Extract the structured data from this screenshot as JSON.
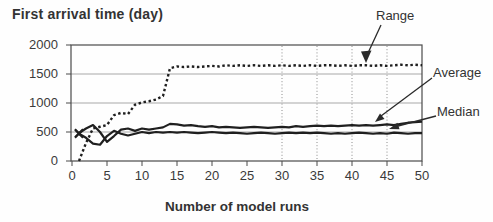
{
  "chart_data": {
    "type": "line",
    "title": "First arrival time (day)",
    "xlabel": "Number of model runs",
    "ylabel": "",
    "xlim": [
      0,
      50
    ],
    "ylim": [
      0,
      2000
    ],
    "xticks": [
      0,
      5,
      10,
      15,
      20,
      25,
      30,
      35,
      40,
      45,
      50
    ],
    "yticks": [
      0,
      500,
      1000,
      1500,
      2000
    ],
    "horizontal_gridlines_at_y": [
      500,
      1000,
      1500,
      2000
    ],
    "vertical_gridlines_at_x": [
      30,
      35,
      40,
      45
    ],
    "legend_position": "right-callouts",
    "x": [
      1,
      2,
      3,
      4,
      5,
      6,
      7,
      8,
      9,
      10,
      11,
      12,
      13,
      14,
      15,
      16,
      17,
      18,
      19,
      20,
      21,
      22,
      23,
      24,
      25,
      26,
      27,
      28,
      29,
      30,
      31,
      32,
      33,
      34,
      35,
      36,
      37,
      38,
      39,
      40,
      41,
      42,
      43,
      44,
      45,
      46,
      47,
      48,
      49,
      50
    ],
    "series": [
      {
        "name": "Range",
        "style": "dotted",
        "start_marker": "none",
        "values": [
          0,
          310,
          560,
          590,
          620,
          790,
          830,
          810,
          970,
          1010,
          1030,
          1060,
          1120,
          1600,
          1630,
          1620,
          1630,
          1620,
          1630,
          1640,
          1630,
          1650,
          1640,
          1650,
          1640,
          1650,
          1640,
          1650,
          1640,
          1650,
          1640,
          1650,
          1640,
          1650,
          1640,
          1650,
          1650,
          1640,
          1650,
          1640,
          1650,
          1650,
          1640,
          1650,
          1640,
          1650,
          1660,
          1650,
          1660,
          1650
        ]
      },
      {
        "name": "Average",
        "style": "solid",
        "start_marker": "x",
        "values": [
          480,
          560,
          620,
          500,
          330,
          430,
          540,
          560,
          520,
          560,
          540,
          560,
          580,
          640,
          630,
          610,
          620,
          600,
          590,
          600,
          580,
          590,
          580,
          570,
          580,
          590,
          580,
          570,
          580,
          590,
          580,
          600,
          590,
          600,
          610,
          600,
          610,
          600,
          610,
          620,
          610,
          620,
          610,
          620,
          630,
          620,
          640,
          660,
          670,
          680
        ]
      },
      {
        "name": "Median",
        "style": "solid",
        "start_marker": "x",
        "values": [
          470,
          400,
          300,
          280,
          430,
          520,
          470,
          440,
          470,
          500,
          480,
          500,
          490,
          500,
          490,
          500,
          490,
          480,
          490,
          500,
          490,
          480,
          490,
          480,
          470,
          480,
          490,
          480,
          470,
          480,
          490,
          480,
          490,
          480,
          490,
          480,
          470,
          480,
          470,
          480,
          490,
          480,
          470,
          480,
          470,
          490,
          480,
          470,
          480,
          480
        ]
      }
    ]
  },
  "colors": {
    "series": "#1f1f1f",
    "axis": "#4a4a4a",
    "gridline": "#a8a8a8",
    "gridline_dotted": "#8c8c8c",
    "annotation": "#2a2a2a",
    "text": "#383838",
    "background": "#ffffff"
  }
}
